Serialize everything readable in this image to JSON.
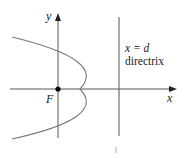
{
  "diagram": {
    "title": "",
    "axes": {
      "x_label": "x",
      "y_label": "y"
    },
    "focus": {
      "label": "F",
      "point": [
        0,
        0
      ]
    },
    "directrix": {
      "equation": "x = d",
      "label": "directrix"
    },
    "curve": {
      "type": "parabola",
      "opens": "left"
    },
    "colors": {
      "axis": "#555555",
      "curve": "#777777",
      "directrix": "#555555",
      "focus_point": "#000000",
      "text": "#222222"
    }
  }
}
